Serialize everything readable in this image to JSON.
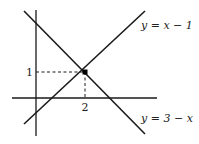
{
  "diagram": {
    "type": "coordinate-graph",
    "axes": {
      "x": "horizontal",
      "y": "vertical"
    },
    "lines": [
      {
        "equation": "y = x − 1",
        "label": "y = x − 1",
        "slope": 1,
        "intercept": -1
      },
      {
        "equation": "y = 3 − x",
        "label": "y = 3 − x",
        "slope": -1,
        "intercept": 3
      }
    ],
    "intersection": {
      "x": 2,
      "y": 1
    },
    "tick_labels": {
      "x": "2",
      "y": "1"
    },
    "colors": {
      "line": "#1a1a1a",
      "axis": "#1a1a1a"
    }
  }
}
